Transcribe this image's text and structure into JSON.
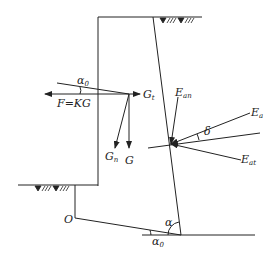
{
  "diagram": {
    "type": "retaining-wall force diagram",
    "labels": {
      "alpha0_top": "α",
      "alpha0_top_sub": "0",
      "F": "F=KG",
      "Gt": "G",
      "Gt_sub": "t",
      "Gn": "G",
      "Gn_sub": "n",
      "G": "G",
      "Ean": "E",
      "Ean_sub": "an",
      "Ea": "E",
      "Ea_sub": "a",
      "delta": "δ",
      "Eat": "E",
      "Eat_sub": "at",
      "O": "O",
      "alpha": "α",
      "alpha0_bottom": "α",
      "alpha0_bottom_sub": "0"
    },
    "colors": {
      "line": "#222222",
      "background": "#ffffff"
    }
  }
}
